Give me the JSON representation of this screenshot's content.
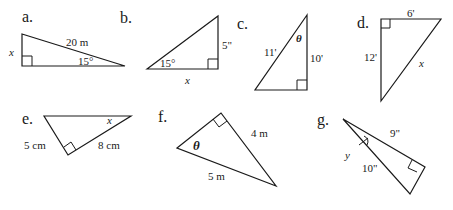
{
  "problems": {
    "a": {
      "label": "a.",
      "hyp": "20 m",
      "angle": "15°",
      "unknown": "x"
    },
    "b": {
      "label": "b.",
      "opp": "5\"",
      "angle": "15°",
      "unknown": "x"
    },
    "c": {
      "label": "c.",
      "hyp": "11'",
      "adj": "10'",
      "unknown": "θ"
    },
    "d": {
      "label": "d.",
      "top": "6'",
      "left": "12'",
      "unknown": "x"
    },
    "e": {
      "label": "e.",
      "left": "5 cm",
      "right": "8 cm",
      "unknown": "x"
    },
    "f": {
      "label": "f.",
      "leg": "4 m",
      "hyp": "5 m",
      "unknown": "θ"
    },
    "g": {
      "label": "g.",
      "leg": "9\"",
      "hyp": "10\"",
      "unknown": "y"
    }
  }
}
